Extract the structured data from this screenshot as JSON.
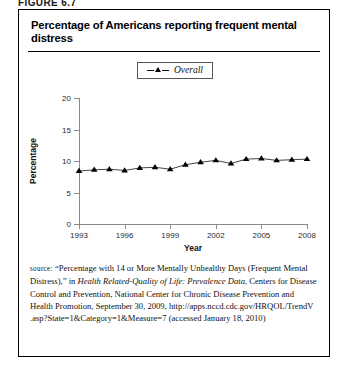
{
  "figure_label": "FIGURE 6.7",
  "title": "Percentage of Americans reporting frequent mental distress",
  "legend": {
    "marker_icon": "triangle-marker-icon",
    "label": "Overall"
  },
  "source_note": {
    "prefix": "source:",
    "part1": " “Percentage with 14 or More Mentally Unhealthy Days (Frequent Mental Distress),” in ",
    "italic1": "Health Related-Quality of Life: Prevalence Data",
    "part2": ", Centers for Disease Control and Prevention, National Center for Chronic Disease Prevention and Health Promotion, September 30, 2009, http://apps.nccd.cdc.gov/HRQOL/TrendV .asp?State=1&Category=1&Measure=7 (accessed January 18, 2010)"
  },
  "chart_data": {
    "type": "line",
    "title": "Percentage of Americans reporting frequent mental distress",
    "xlabel": "Year",
    "ylabel": "Percentage",
    "xlim": [
      1993,
      2008
    ],
    "ylim": [
      0,
      20
    ],
    "xticks": [
      1993,
      1996,
      1999,
      2002,
      2005,
      2008
    ],
    "yticks": [
      0,
      5,
      10,
      15,
      20
    ],
    "grid": false,
    "legend_position": "top-center",
    "marker": "triangle",
    "line_color": "#444444",
    "marker_color": "#000000",
    "x": [
      1993,
      1994,
      1995,
      1996,
      1997,
      1998,
      1999,
      2000,
      2001,
      2002,
      2003,
      2004,
      2005,
      2006,
      2007,
      2008
    ],
    "series": [
      {
        "name": "Overall",
        "values": [
          8.4,
          8.6,
          8.7,
          8.5,
          8.9,
          9.0,
          8.7,
          9.4,
          9.8,
          10.1,
          9.6,
          10.3,
          10.4,
          10.1,
          10.2,
          10.3
        ]
      }
    ]
  }
}
